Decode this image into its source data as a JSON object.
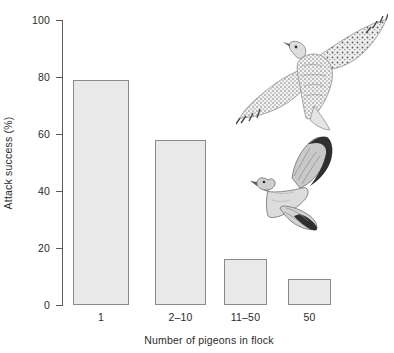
{
  "chart_data": {
    "type": "bar",
    "title": "",
    "subtitle": "",
    "xlabel": "Number of pigeons in flock",
    "ylabel": "Attack success (%)",
    "categories": [
      "1",
      "2–10",
      "11–50",
      "50"
    ],
    "values": [
      79,
      58,
      16,
      9
    ],
    "ylim": [
      0,
      100
    ],
    "yticks": [
      0,
      20,
      40,
      60,
      80,
      100
    ],
    "ytick_labels": [
      "0",
      "20",
      "40",
      "60",
      "80",
      "100"
    ],
    "grid": false,
    "legend": "none",
    "bar_fill_color": "#e9e9e9",
    "bar_edge_color": "#8a8a8a",
    "axis_color": "#5b5b5b",
    "text_color": "#2b2b2b",
    "background_color": "#ffffff"
  },
  "annotations": {
    "hawk_illustration_name": "hawk-illustration",
    "pigeon_illustration_name": "pigeon-illustration"
  }
}
